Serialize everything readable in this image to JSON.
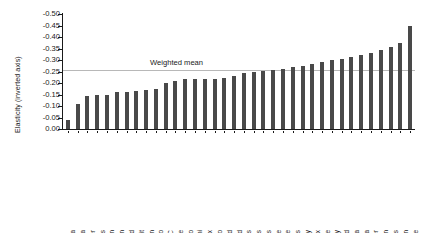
{
  "chart_data": {
    "type": "bar",
    "title": "",
    "xlabel": "",
    "ylabel": "Elasticity (inverted axis)",
    "ylim": [
      0.0,
      -0.5
    ],
    "inverted_y": true,
    "grid": false,
    "legend": null,
    "ytick_labels": [
      "-0.50",
      "-0.45",
      "-0.40",
      "-0.35",
      "-0.30",
      "-0.25",
      "-0.20",
      "-0.15",
      "-0.10",
      "-0.05",
      "0.00"
    ],
    "ytick_values": [
      -0.5,
      -0.45,
      -0.4,
      -0.35,
      -0.3,
      -0.25,
      -0.2,
      -0.15,
      -0.1,
      -0.05,
      0.0
    ],
    "annotations": [
      {
        "name": "weighted-mean",
        "label": "Weighted mean",
        "value": -0.255
      }
    ],
    "categories": [
      "San Francisco area",
      "Atlanta",
      "Boulder",
      "Los Angeles",
      "New York/Brooklyn",
      "Boston",
      "Hartford",
      "Detroit",
      "New York/Manhattan",
      "San Antonio",
      "Washington DC",
      "Albuquerque",
      "Chicago",
      "Miami",
      "New York/Bronx",
      "San Francisco",
      "Cleveland",
      "Portland",
      "Indianapolis",
      "New Orleans",
      "St Louis",
      "Baltimore",
      "Seattle",
      "Dallas",
      "New York/New Jersey",
      "Phoenix",
      "Jacksonville",
      "Kansas City",
      "New York/Long Island",
      "Tampa",
      "Philadelphia",
      "Denver",
      "Houston",
      "Memphis",
      "Tucson",
      "Milwaukee"
    ],
    "values": [
      -0.04,
      -0.11,
      -0.142,
      -0.148,
      -0.148,
      -0.16,
      -0.162,
      -0.165,
      -0.168,
      -0.172,
      -0.2,
      -0.208,
      -0.218,
      -0.218,
      -0.218,
      -0.218,
      -0.222,
      -0.232,
      -0.242,
      -0.248,
      -0.252,
      -0.258,
      -0.262,
      -0.268,
      -0.275,
      -0.282,
      -0.292,
      -0.298,
      -0.305,
      -0.315,
      -0.322,
      -0.33,
      -0.345,
      -0.358,
      -0.372,
      -0.448
    ],
    "bar_color": "#494949",
    "mean_line_color": "#b8b8b8"
  }
}
